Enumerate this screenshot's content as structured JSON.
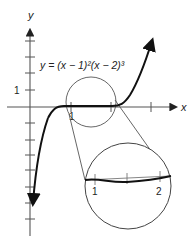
{
  "diagram": {
    "equation_label": "y = (x − 1)²(x − 2)³",
    "axes": {
      "x_label": "x",
      "y_label": "y",
      "x_tick_label": "1",
      "y_tick_label": "1"
    },
    "inset": {
      "description": "magnified view of the curve near the x-axis between x = 1 and x = 2",
      "tick_labels": [
        "1",
        "2"
      ]
    },
    "colors": {
      "curve": "#111111",
      "axes": "#555555",
      "circle": "#444444"
    }
  }
}
